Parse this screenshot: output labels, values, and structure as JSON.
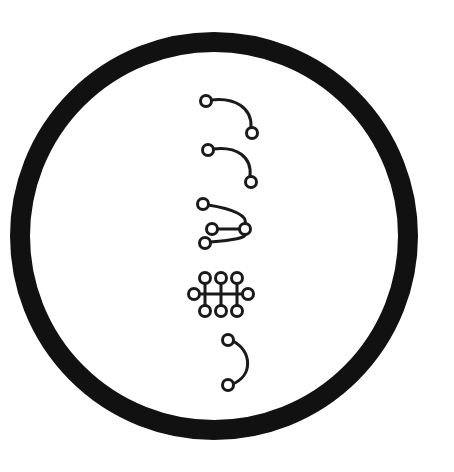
{
  "canvas": {
    "width": 454,
    "height": 472,
    "background": "#ffffff",
    "ink": "#111111"
  },
  "ring": {
    "label": "outer-ring",
    "center_x": 214,
    "center_y": 236,
    "outer_radius": 204,
    "stroke_width": 20,
    "color": "#111111",
    "shape": "annulus"
  },
  "diagram": {
    "title": "",
    "stroke_color": "#1a1a1a",
    "node_fill": "#ffffff",
    "node_stroke": "#1a1a1a",
    "node_stroke_width": 3,
    "node_radius": 5.5,
    "figure_count": 5,
    "figures": [
      {
        "id": "figure-1",
        "name": "hook-arc-upper",
        "type": "arc",
        "node_count": 2,
        "edge_count": 1,
        "stroke_width": 3,
        "nodes": [
          {
            "id": "n1",
            "x": 206,
            "y": 101
          },
          {
            "id": "n2",
            "x": 252,
            "y": 133
          }
        ],
        "edges": [
          {
            "from": "n1",
            "to": "n2",
            "path": "M 211 100 C 235 97 252 108 251 127"
          }
        ]
      },
      {
        "id": "figure-2",
        "name": "hook-arc-lower",
        "type": "arc",
        "node_count": 2,
        "edge_count": 1,
        "stroke_width": 3,
        "nodes": [
          {
            "id": "n1",
            "x": 208,
            "y": 150
          },
          {
            "id": "n2",
            "x": 251,
            "y": 182
          }
        ],
        "edges": [
          {
            "from": "n1",
            "to": "n2",
            "path": "M 213 149 C 237 146 252 157 250 176"
          }
        ]
      },
      {
        "id": "figure-3",
        "name": "trident-fan",
        "type": "fan",
        "node_count": 4,
        "edge_count": 3,
        "stroke_width": 3,
        "nodes": [
          {
            "id": "n1",
            "x": 203,
            "y": 204
          },
          {
            "id": "n2",
            "x": 212,
            "y": 229
          },
          {
            "id": "n3",
            "x": 205,
            "y": 243
          },
          {
            "id": "hub",
            "x": 245,
            "y": 229
          }
        ],
        "edges": [
          {
            "from": "n1",
            "to": "hub",
            "path": "M 208 205 C 234 209 248 216 245 224"
          },
          {
            "from": "n2",
            "to": "hub",
            "path": "M 218 229 L 239 229"
          },
          {
            "from": "n3",
            "to": "hub",
            "path": "M 210 242 C 234 240 246 238 245 234"
          }
        ]
      },
      {
        "id": "figure-4",
        "name": "grid-lattice",
        "type": "lattice",
        "node_count": 8,
        "edge_count": 4,
        "stroke_width": 3,
        "nodes": [
          {
            "id": "t1",
            "x": 205,
            "y": 278
          },
          {
            "id": "t2",
            "x": 221,
            "y": 278
          },
          {
            "id": "t3",
            "x": 237,
            "y": 278
          },
          {
            "id": "l",
            "x": 194,
            "y": 294
          },
          {
            "id": "r",
            "x": 248,
            "y": 294
          },
          {
            "id": "b1",
            "x": 205,
            "y": 311
          },
          {
            "id": "b2",
            "x": 221,
            "y": 311
          },
          {
            "id": "b3",
            "x": 237,
            "y": 311
          }
        ],
        "edges": [
          {
            "from": "l",
            "to": "r",
            "path": "M 200 294 L 242 294"
          },
          {
            "from": "t1",
            "to": "b1",
            "path": "M 205 284 L 205 306"
          },
          {
            "from": "t2",
            "to": "b2",
            "path": "M 221 284 L 221 306"
          },
          {
            "from": "t3",
            "to": "b3",
            "path": "M 237 284 L 237 306"
          }
        ]
      },
      {
        "id": "figure-5",
        "name": "c-arc",
        "type": "arc",
        "node_count": 2,
        "edge_count": 1,
        "stroke_width": 3,
        "nodes": [
          {
            "id": "n1",
            "x": 228,
            "y": 340
          },
          {
            "id": "n2",
            "x": 228,
            "y": 385
          }
        ],
        "edges": [
          {
            "from": "n1",
            "to": "n2",
            "path": "M 233 341 C 252 352 253 375 233 384"
          }
        ]
      }
    ]
  }
}
